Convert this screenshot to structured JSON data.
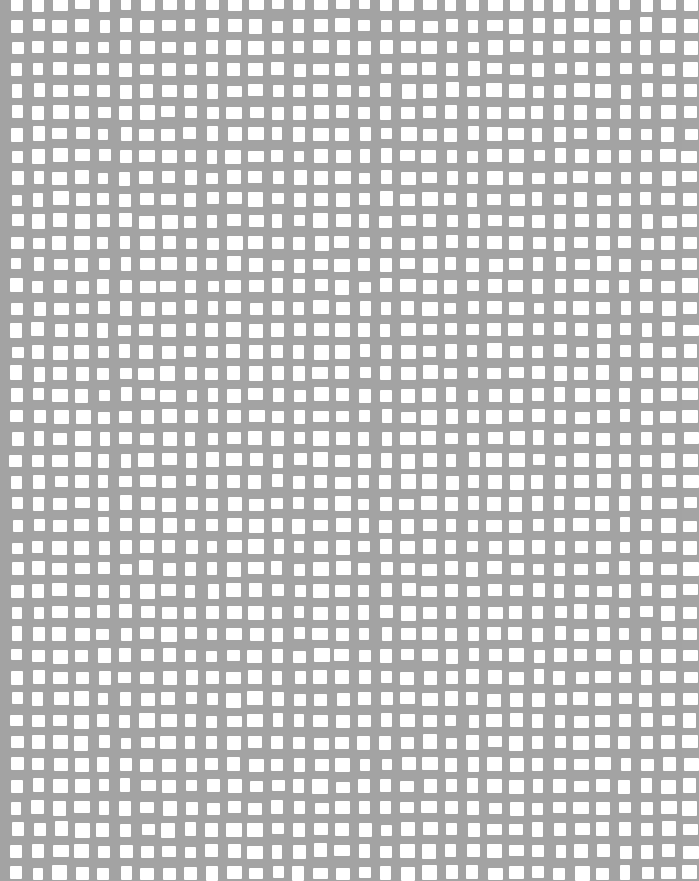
{
  "image": {
    "description": "Grid texture of white square openings on a gray background",
    "colors": {
      "background": "#a3a3a3",
      "hole": "#ffffff"
    },
    "grid": {
      "columns": 31,
      "rows": 41
    }
  }
}
